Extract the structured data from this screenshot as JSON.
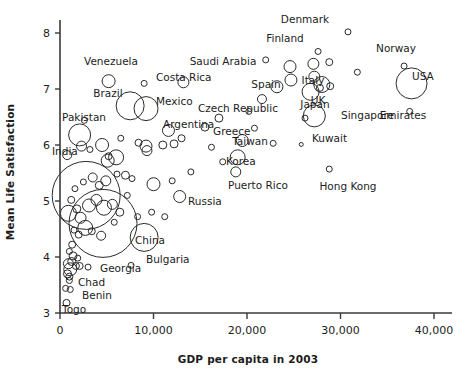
{
  "chart_data": {
    "type": "scatter",
    "title": "",
    "subtitle": "",
    "xlabel": "GDP per capita in 2003",
    "ylabel": "Mean Life Satisfaction",
    "xlim": [
      0,
      42500
    ],
    "ylim": [
      2.85,
      8.3
    ],
    "grid": false,
    "legend": "none",
    "note": "Bubble scatter; bubble area encodes country population. Only a subset of bubbles are labeled.",
    "xticks": [
      0,
      10000,
      20000,
      30000,
      40000
    ],
    "xticklabels": [
      "0",
      "10,000",
      "20,000",
      "30,000",
      "40,000"
    ],
    "yticks": [
      3,
      4,
      5,
      6,
      7,
      8
    ],
    "yticklabels": [
      "3",
      "4",
      "5",
      "6",
      "7",
      "8"
    ],
    "marker_style": "open circle, black outline, no fill",
    "labeled_points": [
      {
        "name": "Venezuela",
        "x": 5200,
        "y": 7.14,
        "r": 6.5,
        "lx": 111,
        "ly": 65,
        "anchor": "middle"
      },
      {
        "name": "Costa Rica",
        "x": 9000,
        "y": 7.1,
        "r": 3.0,
        "lx": 156,
        "ly": 81,
        "anchor": "start"
      },
      {
        "name": "Saudi Arabia",
        "x": 13200,
        "y": 7.12,
        "r": 5.5,
        "lx": 223,
        "ly": 65,
        "anchor": "middle"
      },
      {
        "name": "Denmark",
        "x": 30800,
        "y": 8.02,
        "r": 3.0,
        "lx": 305,
        "ly": 23,
        "anchor": "middle"
      },
      {
        "name": "Finland",
        "x": 27600,
        "y": 7.67,
        "r": 3.0,
        "lx": 285,
        "ly": 42,
        "anchor": "middle"
      },
      {
        "name": "Norway",
        "x": 36800,
        "y": 7.41,
        "r": 3.0,
        "lx": 396,
        "ly": 52,
        "anchor": "middle"
      },
      {
        "name": "USA",
        "x": 37600,
        "y": 7.1,
        "r": 15.5,
        "lx": 412,
        "ly": 80,
        "anchor": "start"
      },
      {
        "name": "Emirates",
        "x": 37400,
        "y": 6.6,
        "r": 3.0,
        "lx": 403,
        "ly": 119,
        "anchor": "middle"
      },
      {
        "name": "Spain",
        "x": 23200,
        "y": 7.04,
        "r": 6.0,
        "lx": 266,
        "ly": 88,
        "anchor": "middle"
      },
      {
        "name": "Italy",
        "x": 26800,
        "y": 6.95,
        "r": 8.5,
        "lx": 313,
        "ly": 84,
        "anchor": "middle"
      },
      {
        "name": "UK",
        "x": 28000,
        "y": 7.08,
        "r": 8.0,
        "lx": 318,
        "ly": 104,
        "anchor": "middle"
      },
      {
        "name": "Japan",
        "x": 27200,
        "y": 6.52,
        "r": 11.0,
        "lx": 315,
        "ly": 108,
        "anchor": "middle"
      },
      {
        "name": "Singapore",
        "x": 26200,
        "y": 6.48,
        "r": 3.0,
        "lx": 341,
        "ly": 119,
        "anchor": "start"
      },
      {
        "name": "Brazil",
        "x": 7500,
        "y": 6.7,
        "r": 14.0,
        "lx": 108,
        "ly": 97,
        "anchor": "middle"
      },
      {
        "name": "Mexico",
        "x": 9200,
        "y": 6.65,
        "r": 12.0,
        "lx": 156,
        "ly": 105,
        "anchor": "start"
      },
      {
        "name": "Czech Republic",
        "x": 17000,
        "y": 6.48,
        "r": 4.0,
        "lx": 198,
        "ly": 112,
        "anchor": "start"
      },
      {
        "name": "Argentina",
        "x": 11600,
        "y": 6.26,
        "r": 6.0,
        "lx": 163,
        "ly": 128,
        "anchor": "start"
      },
      {
        "name": "Greece",
        "x": 19500,
        "y": 6.08,
        "r": 6.0,
        "lx": 213,
        "ly": 135,
        "anchor": "start"
      },
      {
        "name": "Kuwait",
        "x": 25800,
        "y": 6.01,
        "r": 2.0,
        "lx": 312,
        "ly": 142,
        "anchor": "start"
      },
      {
        "name": "Taiwan",
        "x": 22800,
        "y": 6.03,
        "r": 3.0,
        "lx": 250,
        "ly": 145,
        "anchor": "middle"
      },
      {
        "name": "Korea",
        "x": 19000,
        "y": 5.78,
        "r": 7.5,
        "lx": 226,
        "ly": 165,
        "anchor": "start"
      },
      {
        "name": "Pakistan",
        "x": 2100,
        "y": 6.18,
        "r": 11.0,
        "lx": 84,
        "ly": 121,
        "anchor": "middle"
      },
      {
        "name": "India",
        "x": 2800,
        "y": 5.1,
        "r": 34.0,
        "lx": 52,
        "ly": 155,
        "anchor": "start"
      },
      {
        "name": "Puerto Rico",
        "x": 18800,
        "y": 5.52,
        "r": 5.0,
        "lx": 228,
        "ly": 189,
        "anchor": "start"
      },
      {
        "name": "Hong Kong",
        "x": 28800,
        "y": 5.57,
        "r": 3.0,
        "lx": 348,
        "ly": 190,
        "anchor": "middle"
      },
      {
        "name": "Russia",
        "x": 9000,
        "y": 4.35,
        "r": 14.0,
        "lx": 188,
        "ly": 205,
        "anchor": "start"
      },
      {
        "name": "China",
        "x": 4600,
        "y": 4.6,
        "r": 34.0,
        "lx": 135,
        "ly": 244,
        "anchor": "start"
      },
      {
        "name": "Bulgaria",
        "x": 7600,
        "y": 3.85,
        "r": 3.0,
        "lx": 146,
        "ly": 263,
        "anchor": "start"
      },
      {
        "name": "Georgia",
        "x": 3000,
        "y": 3.82,
        "r": 3.0,
        "lx": 100,
        "ly": 272,
        "anchor": "start"
      },
      {
        "name": "Chad",
        "x": 1000,
        "y": 3.65,
        "r": 3.5,
        "lx": 78,
        "ly": 286,
        "anchor": "start"
      },
      {
        "name": "Benin",
        "x": 1100,
        "y": 3.42,
        "r": 3.0,
        "lx": 82,
        "ly": 299,
        "anchor": "start"
      },
      {
        "name": "Togo",
        "x": 700,
        "y": 3.18,
        "r": 3.5,
        "lx": 62,
        "ly": 313,
        "anchor": "start"
      }
    ],
    "unlabeled_points": [
      {
        "x": 770,
        "y": 5.82,
        "r": 4.5
      },
      {
        "x": 2300,
        "y": 5.98,
        "r": 5.0
      },
      {
        "x": 3200,
        "y": 5.92,
        "r": 3.0
      },
      {
        "x": 4500,
        "y": 6.0,
        "r": 6.5
      },
      {
        "x": 5200,
        "y": 5.8,
        "r": 3.5
      },
      {
        "x": 5100,
        "y": 5.72,
        "r": 6.5
      },
      {
        "x": 6000,
        "y": 5.78,
        "r": 7.5
      },
      {
        "x": 6500,
        "y": 6.12,
        "r": 3.0
      },
      {
        "x": 8400,
        "y": 6.04,
        "r": 3.5
      },
      {
        "x": 9200,
        "y": 5.98,
        "r": 6.0
      },
      {
        "x": 9300,
        "y": 5.9,
        "r": 5.0
      },
      {
        "x": 13000,
        "y": 6.12,
        "r": 3.5
      },
      {
        "x": 15500,
        "y": 6.32,
        "r": 4.0
      },
      {
        "x": 20800,
        "y": 6.3,
        "r": 3.0
      },
      {
        "x": 20200,
        "y": 6.6,
        "r": 3.0
      },
      {
        "x": 21600,
        "y": 6.82,
        "r": 4.5
      },
      {
        "x": 24600,
        "y": 7.4,
        "r": 6.0
      },
      {
        "x": 24700,
        "y": 7.16,
        "r": 6.0
      },
      {
        "x": 27100,
        "y": 7.45,
        "r": 5.5
      },
      {
        "x": 27200,
        "y": 7.22,
        "r": 5.5
      },
      {
        "x": 28800,
        "y": 7.48,
        "r": 3.5
      },
      {
        "x": 28900,
        "y": 7.05,
        "r": 3.5
      },
      {
        "x": 27800,
        "y": 7.02,
        "r": 3.5
      },
      {
        "x": 22000,
        "y": 7.52,
        "r": 3.0
      },
      {
        "x": 31800,
        "y": 7.3,
        "r": 3.0
      },
      {
        "x": 16200,
        "y": 5.96,
        "r": 3.0
      },
      {
        "x": 17400,
        "y": 5.7,
        "r": 3.0
      },
      {
        "x": 14000,
        "y": 5.52,
        "r": 3.0
      },
      {
        "x": 12000,
        "y": 5.36,
        "r": 3.0
      },
      {
        "x": 10000,
        "y": 5.3,
        "r": 6.5
      },
      {
        "x": 7000,
        "y": 5.46,
        "r": 4.0
      },
      {
        "x": 7700,
        "y": 5.4,
        "r": 3.0
      },
      {
        "x": 6100,
        "y": 5.48,
        "r": 3.0
      },
      {
        "x": 4900,
        "y": 5.36,
        "r": 5.0
      },
      {
        "x": 4200,
        "y": 5.28,
        "r": 4.0
      },
      {
        "x": 3500,
        "y": 5.42,
        "r": 4.5
      },
      {
        "x": 2500,
        "y": 5.34,
        "r": 3.0
      },
      {
        "x": 1600,
        "y": 5.22,
        "r": 3.0
      },
      {
        "x": 1200,
        "y": 5.02,
        "r": 3.5
      },
      {
        "x": 900,
        "y": 4.78,
        "r": 8.0
      },
      {
        "x": 1800,
        "y": 4.86,
        "r": 4.0
      },
      {
        "x": 2200,
        "y": 4.7,
        "r": 5.5
      },
      {
        "x": 3100,
        "y": 4.92,
        "r": 6.5
      },
      {
        "x": 3900,
        "y": 5.02,
        "r": 5.5
      },
      {
        "x": 4700,
        "y": 4.88,
        "r": 7.5
      },
      {
        "x": 5600,
        "y": 4.94,
        "r": 5.0
      },
      {
        "x": 6400,
        "y": 4.8,
        "r": 4.0
      },
      {
        "x": 8300,
        "y": 4.72,
        "r": 3.0
      },
      {
        "x": 11200,
        "y": 4.72,
        "r": 3.0
      },
      {
        "x": 2700,
        "y": 4.52,
        "r": 7.5
      },
      {
        "x": 3400,
        "y": 4.46,
        "r": 3.5
      },
      {
        "x": 4400,
        "y": 4.38,
        "r": 4.5
      },
      {
        "x": 2000,
        "y": 4.4,
        "r": 3.5
      },
      {
        "x": 1500,
        "y": 4.48,
        "r": 3.0
      },
      {
        "x": 1300,
        "y": 4.22,
        "r": 3.5
      },
      {
        "x": 1000,
        "y": 4.1,
        "r": 3.0
      },
      {
        "x": 1400,
        "y": 4.02,
        "r": 4.0
      },
      {
        "x": 1900,
        "y": 3.98,
        "r": 3.0
      },
      {
        "x": 900,
        "y": 3.88,
        "r": 5.0
      },
      {
        "x": 1100,
        "y": 3.78,
        "r": 6.5
      },
      {
        "x": 1700,
        "y": 3.84,
        "r": 3.5
      },
      {
        "x": 2100,
        "y": 3.84,
        "r": 3.5
      },
      {
        "x": 800,
        "y": 3.7,
        "r": 4.0
      },
      {
        "x": 1000,
        "y": 3.58,
        "r": 3.0
      },
      {
        "x": 1250,
        "y": 3.92,
        "r": 4.0
      },
      {
        "x": 600,
        "y": 3.44,
        "r": 3.0
      },
      {
        "x": 5800,
        "y": 4.62,
        "r": 3.0
      },
      {
        "x": 7200,
        "y": 5.1,
        "r": 3.0
      },
      {
        "x": 9800,
        "y": 4.8,
        "r": 3.0
      },
      {
        "x": 12800,
        "y": 5.08,
        "r": 6.0
      },
      {
        "x": 2600,
        "y": 6.44,
        "r": 3.0
      },
      {
        "x": 11000,
        "y": 6.0,
        "r": 4.0
      },
      {
        "x": 12200,
        "y": 6.02,
        "r": 4.0
      }
    ]
  },
  "axes": {
    "x_title": "GDP per capita in 2003",
    "y_title": "Mean Life Satisfaction"
  }
}
